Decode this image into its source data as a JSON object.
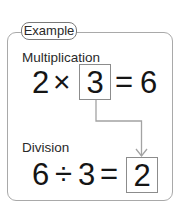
{
  "header": {
    "label": "Example"
  },
  "multiplication": {
    "title": "Multiplication",
    "left": "2",
    "operator": "×",
    "boxed": "3",
    "equals": "=",
    "result": "6"
  },
  "division": {
    "title": "Division",
    "left": "6",
    "operator": "÷",
    "right": "3",
    "equals": "=",
    "boxed": "2"
  },
  "arrow": {
    "from": "multiplication.boxed",
    "to": "division.boxed",
    "icon": "elbow-arrow-down-icon"
  },
  "colors": {
    "text": "#1c1c1c",
    "outer_border": "#a9a9a9",
    "box_border": "#8c8c8c",
    "arrow": "#a0a0a0"
  }
}
